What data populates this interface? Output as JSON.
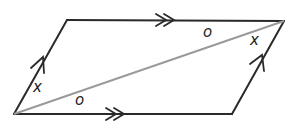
{
  "diagram": {
    "type": "parallelogram-with-diagonal",
    "colors": {
      "stroke": "#2a2a2a",
      "diagonal": "#9a9a9a",
      "background": "#ffffff"
    },
    "vertices": {
      "bottom_left": [
        14,
        114
      ],
      "top_left": [
        67,
        20
      ],
      "top_right": [
        284,
        21
      ],
      "bottom_right": [
        232,
        114
      ]
    },
    "angle_labels": [
      {
        "id": "x-bottom-left",
        "text": "x",
        "pos": [
          33,
          80
        ]
      },
      {
        "id": "o-bottom-left",
        "text": "o",
        "pos": [
          75,
          93
        ]
      },
      {
        "id": "o-top-right",
        "text": "o",
        "pos": [
          203,
          25
        ]
      },
      {
        "id": "x-top-right",
        "text": "x",
        "pos": [
          250,
          33
        ]
      }
    ],
    "markings": {
      "single_arrows": "left and right sides (parallel pair)",
      "double_arrows": "top and bottom sides (parallel pair)"
    }
  }
}
